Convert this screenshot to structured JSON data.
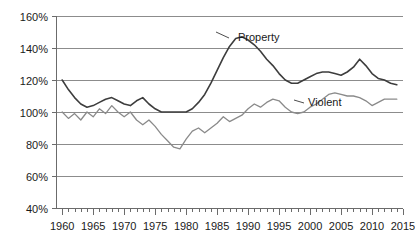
{
  "chart_data": {
    "type": "line",
    "title": "",
    "subtitle": "",
    "xlabel": "",
    "ylabel": "",
    "xlim": [
      1959,
      2015
    ],
    "ylim": [
      40,
      160
    ],
    "ytick_step": 20,
    "xtick_step": 5,
    "minor_xtick_step": 1,
    "grid": "horizontal",
    "legend_position": "inline-annotation",
    "ytick_labels": [
      "40%",
      "60%",
      "80%",
      "100%",
      "120%",
      "140%",
      "160%"
    ],
    "ytick_values": [
      40,
      60,
      80,
      100,
      120,
      140,
      160
    ],
    "xtick_labels": [
      "1960",
      "1965",
      "1970",
      "1975",
      "1980",
      "1985",
      "1990",
      "1995",
      "2000",
      "2005",
      "2010",
      "2015"
    ],
    "xtick_values": [
      1960,
      1965,
      1970,
      1975,
      1980,
      1985,
      1990,
      1995,
      2000,
      2005,
      2010,
      2015
    ],
    "x": [
      1960,
      1961,
      1962,
      1963,
      1964,
      1965,
      1966,
      1967,
      1968,
      1969,
      1970,
      1971,
      1972,
      1973,
      1974,
      1975,
      1976,
      1977,
      1978,
      1979,
      1980,
      1981,
      1982,
      1983,
      1984,
      1985,
      1986,
      1987,
      1988,
      1989,
      1990,
      1991,
      1992,
      1993,
      1994,
      1995,
      1996,
      1997,
      1998,
      1999,
      2000,
      2001,
      2002,
      2003,
      2004,
      2005,
      2006,
      2007,
      2008,
      2009,
      2010,
      2011,
      2012,
      2013,
      2014
    ],
    "series": [
      {
        "name": "Property",
        "color": "#3d3d3d",
        "width": 1.6,
        "values": [
          120,
          114,
          109,
          105,
          103,
          104,
          106,
          108,
          109,
          107,
          105,
          104,
          107,
          109,
          105,
          102,
          100,
          100,
          100,
          100,
          100,
          102,
          106,
          111,
          118,
          126,
          134,
          141,
          146,
          147,
          145,
          142,
          138,
          133,
          129,
          124,
          120,
          118,
          118,
          120,
          122,
          124,
          125,
          125,
          124,
          123,
          125,
          128,
          133,
          129,
          124,
          121,
          120,
          118,
          117
        ]
      },
      {
        "name": "Violent",
        "color": "#8a8a8a",
        "width": 1.3,
        "values": [
          100,
          96,
          99,
          95,
          100,
          97,
          102,
          99,
          104,
          100,
          97,
          100,
          95,
          92,
          95,
          91,
          86,
          82,
          78,
          77,
          83,
          88,
          90,
          87,
          90,
          93,
          97,
          94,
          96,
          98,
          102,
          105,
          103,
          106,
          108,
          107,
          103,
          100,
          99,
          100,
          103,
          105,
          108,
          111,
          112,
          111,
          110,
          110,
          109,
          107,
          104,
          106,
          108,
          108,
          108
        ]
      }
    ],
    "annotations": [
      {
        "name": "Property",
        "text": "Property",
        "text_x": 238,
        "text_y": 41,
        "leader": [
          [
            229,
            38
          ],
          [
            216,
            32
          ]
        ]
      },
      {
        "name": "Violent",
        "text": "Violent",
        "text_x": 308,
        "text_y": 106,
        "leader": [
          [
            304,
            103
          ],
          [
            294,
            100
          ]
        ]
      }
    ]
  },
  "plot_geometry": {
    "left": 56,
    "right": 403,
    "top": 16,
    "bottom": 208
  }
}
